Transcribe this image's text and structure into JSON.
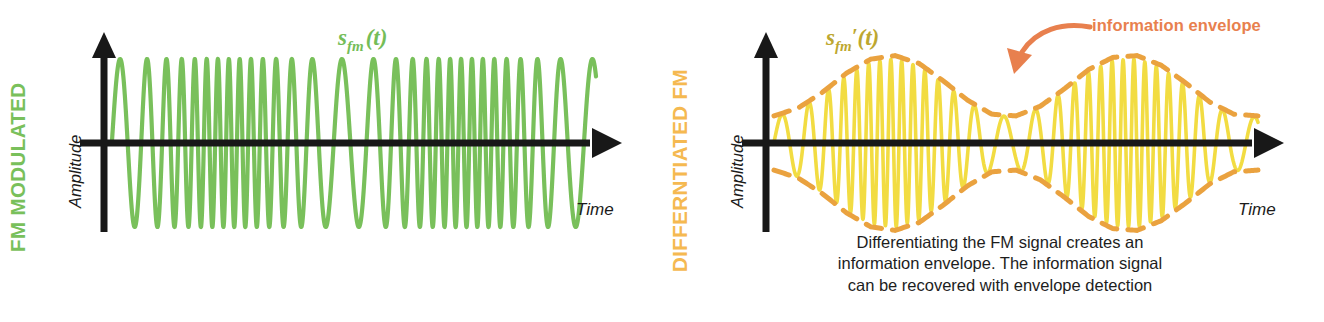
{
  "figure": {
    "background_color": "#ffffff"
  },
  "colors": {
    "fm_green": "#79c05b",
    "diff_yellow": "#f2dc42",
    "envelope_orange": "#eaa23f",
    "annotation_orange": "#e8804e",
    "side_label_green": "#79c05b",
    "side_label_orange": "#f5b951",
    "axis_black": "#181818",
    "signal_label_green": "#74bd58",
    "signal_label_olive": "#bda72f"
  },
  "panels": [
    {
      "id": "fm-modulated",
      "side_label": "FM MODULATED",
      "signal_label": {
        "base": "s",
        "subscript": "fm",
        "prime": "",
        "argument": "(t)"
      },
      "y_axis_label": "Amplitude",
      "x_axis_label": "Time"
    },
    {
      "id": "differentiated-fm",
      "side_label": "DIFFERNTIATED FM",
      "signal_label": {
        "base": "s",
        "subscript": "fm",
        "prime": "′",
        "argument": "(t)"
      },
      "y_axis_label": "Amplitude",
      "x_axis_label": "Time",
      "annotation": "information envelope",
      "caption_lines": [
        "Differentiating the FM signal creates an",
        "information envelope. The information signal",
        "can be recovered with envelope detection"
      ]
    }
  ],
  "chart_data": [
    {
      "type": "line",
      "id": "fm-modulated-waveform",
      "title": "FM MODULATED",
      "xlabel": "Time",
      "ylabel": "Amplitude",
      "series_name": "s_fm(t)",
      "color": "#79c05b",
      "description": "Frequency modulated carrier: constant amplitude, instantaneous frequency varies with the information signal.",
      "carrier_amplitude": 1.0,
      "carrier_freq_hz": 26,
      "modulation_index": 17,
      "message_freq_hz": 2.0,
      "message_phase_deg": -90,
      "xlim": [
        0,
        1
      ],
      "ylim": [
        -1.15,
        1.15
      ],
      "grid": false,
      "legend": "none",
      "x": [
        0.0,
        0.05,
        0.1,
        0.15,
        0.2,
        0.25,
        0.3,
        0.35,
        0.4,
        0.45,
        0.5,
        0.55,
        0.6,
        0.65,
        0.7,
        0.75,
        0.8,
        0.85,
        0.9,
        0.95,
        1.0
      ],
      "instantaneous_freq": [
        14,
        18,
        26,
        36,
        43,
        45,
        41,
        32,
        22,
        15,
        14,
        19,
        28,
        38,
        44,
        45,
        40,
        31,
        21,
        15,
        14
      ],
      "envelope_upper": [
        1,
        1,
        1,
        1,
        1,
        1,
        1,
        1,
        1,
        1,
        1,
        1,
        1,
        1,
        1,
        1,
        1,
        1,
        1,
        1,
        1
      ],
      "envelope_lower": [
        -1,
        -1,
        -1,
        -1,
        -1,
        -1,
        -1,
        -1,
        -1,
        -1,
        -1,
        -1,
        -1,
        -1,
        -1,
        -1,
        -1,
        -1,
        -1,
        -1,
        -1
      ]
    },
    {
      "type": "line",
      "id": "differentiated-fm-waveform",
      "title": "DIFFERNTIATED FM",
      "xlabel": "Time",
      "ylabel": "Amplitude",
      "series_name": "s_fm'(t)",
      "color": "#f2dc42",
      "envelope_color": "#eaa23f",
      "envelope_style": "dashed",
      "description": "Derivative of the FM carrier: amplitude now tracks the instantaneous frequency, producing an AM-like information envelope.",
      "xlim": [
        0,
        1
      ],
      "ylim": [
        -1.15,
        1.15
      ],
      "grid": false,
      "legend": "none",
      "x": [
        0.0,
        0.05,
        0.1,
        0.15,
        0.2,
        0.25,
        0.3,
        0.35,
        0.4,
        0.45,
        0.5,
        0.55,
        0.6,
        0.65,
        0.7,
        0.75,
        0.8,
        0.85,
        0.9,
        0.95,
        1.0
      ],
      "instantaneous_freq": [
        14,
        18,
        26,
        36,
        43,
        45,
        41,
        32,
        22,
        15,
        14,
        19,
        28,
        38,
        44,
        45,
        40,
        31,
        21,
        15,
        14
      ],
      "envelope_upper": [
        0.31,
        0.4,
        0.58,
        0.8,
        0.96,
        1.0,
        0.91,
        0.71,
        0.49,
        0.33,
        0.31,
        0.42,
        0.62,
        0.84,
        0.98,
        1.0,
        0.89,
        0.69,
        0.47,
        0.33,
        0.31
      ],
      "envelope_lower": [
        -0.31,
        -0.4,
        -0.58,
        -0.8,
        -0.96,
        -1.0,
        -0.91,
        -0.71,
        -0.49,
        -0.33,
        -0.31,
        -0.42,
        -0.62,
        -0.84,
        -0.98,
        -1.0,
        -0.89,
        -0.69,
        -0.47,
        -0.33,
        -0.31
      ],
      "annotations": [
        {
          "text": "information envelope",
          "points_to": "envelope peak",
          "color": "#e8804e"
        }
      ]
    }
  ]
}
